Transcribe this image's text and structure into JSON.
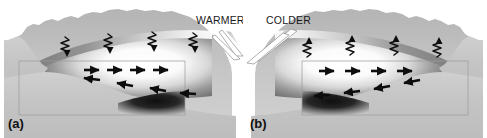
{
  "figure": {
    "width": 487,
    "height": 138,
    "background_color": "#ffffff",
    "type": "scientific-diagram"
  },
  "panels": [
    {
      "id": "a",
      "label": "(a)",
      "temperature_label": "WARMER",
      "wavy_arrow_direction": "down",
      "wavy_arrow_count": 4,
      "upper_flow_direction": "right",
      "upper_arrow_count": 4,
      "lower_flow_direction": "left",
      "lower_arrow_count": 4,
      "description": "daytime upvalley circulation cross-section"
    },
    {
      "id": "b",
      "label": "(b)",
      "temperature_label": "COLDER",
      "wavy_arrow_direction": "up",
      "wavy_arrow_count": 4,
      "upper_flow_direction": "right",
      "upper_arrow_count": 4,
      "lower_flow_direction": "left",
      "lower_arrow_count": 4,
      "description": "nighttime downvalley circulation cross-section"
    }
  ],
  "colors": {
    "terrain_light": "#c9c9c9",
    "terrain_mid": "#b0b0b0",
    "terrain_dark": "#8f8f8f",
    "air_light": "#ffffff",
    "air_dark": "#1a1a1a",
    "arrow": "#0d0d0d",
    "frame": "#9a9a9a",
    "text": "#111111",
    "background": "#ffffff"
  }
}
